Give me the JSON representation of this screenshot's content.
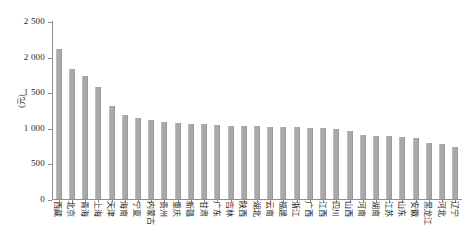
{
  "chart_data": {
    "type": "bar",
    "title": "",
    "xlabel": "",
    "ylabel": "(元)",
    "ylim": [
      0,
      2500
    ],
    "ytick_values": [
      0,
      500,
      1000,
      1500,
      2000,
      2500
    ],
    "ytick_labels": [
      "0",
      "500",
      "1 000",
      "1 500",
      "2 000",
      "2 500"
    ],
    "grid": false,
    "legend": "none",
    "bar_color": "#a9a9a9",
    "categories": [
      "西藏",
      "北京",
      "青海",
      "上海",
      "天津",
      "海南",
      "宁夏",
      "内蒙古",
      "贵州",
      "重庆",
      "新疆",
      "甘肃",
      "广东",
      "吉林",
      "陕西",
      "湖北",
      "云南",
      "福建",
      "浙江",
      "广西",
      "江西",
      "四川",
      "山西",
      "河南",
      "湖南",
      "江苏",
      "山东",
      "安徽",
      "黑龙江",
      "河北",
      "辽宁"
    ],
    "values": [
      2110,
      1820,
      1725,
      1570,
      1300,
      1180,
      1140,
      1110,
      1080,
      1070,
      1060,
      1050,
      1040,
      1030,
      1030,
      1020,
      1010,
      1010,
      1010,
      1000,
      1000,
      985,
      960,
      900,
      890,
      880,
      875,
      860,
      790,
      770,
      725
    ]
  },
  "axis": {
    "y_title": "(元)"
  }
}
